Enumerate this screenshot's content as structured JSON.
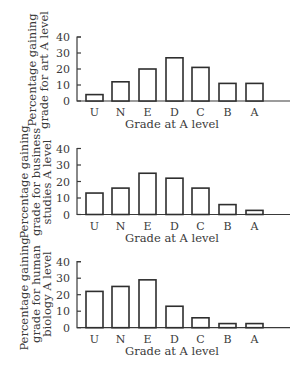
{
  "chart_data": [
    {
      "type": "bar",
      "title": "",
      "categories": [
        "U",
        "N",
        "E",
        "D",
        "C",
        "B",
        "A"
      ],
      "values": [
        4,
        12,
        20,
        27,
        21,
        11,
        11
      ],
      "xlabel": "Grade at A level",
      "ylabel": "Percentage gaining grade for art A level",
      "ylabel_lines": [
        "Percentage gaining",
        "grade for art A level"
      ],
      "yticks": [
        0,
        10,
        20,
        30,
        40
      ],
      "ylim": [
        0,
        40
      ],
      "grid": false,
      "legend": null
    },
    {
      "type": "bar",
      "title": "",
      "categories": [
        "U",
        "N",
        "E",
        "D",
        "C",
        "B",
        "A"
      ],
      "values": [
        13,
        16,
        25,
        22,
        16,
        6,
        2.5
      ],
      "xlabel": "Grade at A level",
      "ylabel": "Percentage gaining grade for business studies A level",
      "ylabel_lines": [
        "Percentage gaining",
        "grade for business",
        "studies A level"
      ],
      "yticks": [
        0,
        10,
        20,
        30,
        40
      ],
      "ylim": [
        0,
        40
      ],
      "grid": false,
      "legend": null
    },
    {
      "type": "bar",
      "title": "",
      "categories": [
        "U",
        "N",
        "E",
        "D",
        "C",
        "B",
        "A"
      ],
      "values": [
        22,
        25,
        29,
        13,
        6,
        2.5,
        2.5
      ],
      "xlabel": "Grade at A level",
      "ylabel": "Percentage gaining grade for human biology A level",
      "ylabel_lines": [
        "Percentage gaining",
        "grade for human",
        "biology A level"
      ],
      "yticks": [
        0,
        10,
        20,
        30,
        40
      ],
      "ylim": [
        0,
        40
      ],
      "grid": false,
      "legend": null
    }
  ],
  "colors": {
    "bar_fill": "#ffffff",
    "bar_stroke": "#2e2e2e",
    "axis": "#3a3a3a",
    "text": "#3a3a3a"
  }
}
